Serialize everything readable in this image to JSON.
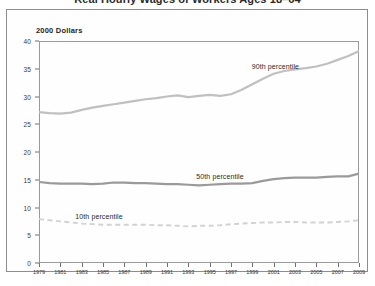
{
  "title": {
    "text": "Real Hourly Wages of Workers Ages 18–64",
    "clipped": true
  },
  "unit_label": "2000 Dollars",
  "chart_data": {
    "type": "line",
    "title": "Real Hourly Wages of Workers Ages 18–64",
    "subtitle": "",
    "xlabel": "",
    "ylabel": "2000 Dollars",
    "xlim": [
      1979,
      2009
    ],
    "ylim": [
      0,
      40
    ],
    "grid": false,
    "legend": "inline-annotations",
    "x": [
      1979,
      1980,
      1981,
      1982,
      1983,
      1984,
      1985,
      1986,
      1987,
      1988,
      1989,
      1990,
      1991,
      1992,
      1993,
      1994,
      1995,
      1996,
      1997,
      1998,
      1999,
      2000,
      2001,
      2002,
      2003,
      2004,
      2005,
      2006,
      2007,
      2008,
      2009
    ],
    "xticks": [
      1979,
      1981,
      1983,
      1985,
      1987,
      1989,
      1991,
      1993,
      1995,
      1997,
      1999,
      2001,
      2003,
      2005,
      2007,
      2009
    ],
    "xtick_labels": [
      "1979",
      "1981",
      "1983",
      "1985",
      "1987",
      "1989",
      "1991",
      "1993",
      "1995",
      "1997",
      "1999",
      "2001",
      "2003",
      "2005",
      "2007",
      "2009"
    ],
    "yticks": [
      0,
      5,
      10,
      15,
      20,
      25,
      30,
      35,
      40
    ],
    "ytick_labels": [
      "0",
      "5",
      "10",
      "15",
      "20",
      "25",
      "30",
      "35",
      "40"
    ],
    "series": [
      {
        "name": "90th percentile",
        "style": "solid",
        "color": "#c0c0c0",
        "label_text": "90th percentile",
        "values": [
          27.2,
          27.0,
          26.9,
          27.1,
          27.6,
          28.0,
          28.3,
          28.6,
          28.9,
          29.2,
          29.5,
          29.7,
          30.0,
          30.2,
          29.9,
          30.1,
          30.3,
          30.1,
          30.4,
          31.2,
          32.2,
          33.2,
          34.1,
          34.6,
          34.9,
          35.1,
          35.4,
          35.9,
          36.6,
          37.3,
          38.2
        ]
      },
      {
        "name": "50th percentile",
        "style": "solid",
        "color": "#9a9a9a",
        "label_text": "50th percentile",
        "values": [
          14.6,
          14.4,
          14.3,
          14.3,
          14.3,
          14.2,
          14.3,
          14.5,
          14.5,
          14.4,
          14.4,
          14.3,
          14.2,
          14.2,
          14.1,
          14.0,
          14.1,
          14.2,
          14.3,
          14.3,
          14.4,
          14.8,
          15.1,
          15.3,
          15.4,
          15.4,
          15.4,
          15.5,
          15.6,
          15.6,
          16.1
        ]
      },
      {
        "name": "10th percentile",
        "style": "dashed",
        "color": "#d2d2d2",
        "label_text": "10th percentile",
        "values": [
          7.9,
          7.7,
          7.5,
          7.3,
          7.1,
          7.0,
          6.9,
          6.9,
          6.9,
          6.9,
          6.9,
          6.8,
          6.8,
          6.7,
          6.6,
          6.7,
          6.7,
          6.8,
          7.0,
          7.1,
          7.2,
          7.3,
          7.3,
          7.4,
          7.4,
          7.3,
          7.3,
          7.3,
          7.4,
          7.5,
          7.7
        ]
      }
    ]
  }
}
